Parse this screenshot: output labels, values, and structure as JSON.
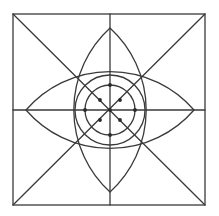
{
  "diagram": {
    "title": "",
    "colors": {
      "background": "#ffffff",
      "stroke": "#3a3a3a",
      "point": "#2a2a2a"
    },
    "square": {
      "x1": 13,
      "y1": 14,
      "x2": 205,
      "y2": 205
    },
    "center": {
      "x": 110,
      "y": 110
    },
    "circles": [
      {
        "name": "outer-circle",
        "r": 35
      },
      {
        "name": "inner-circle",
        "r": 25
      }
    ],
    "lenses": [
      {
        "name": "vertical-lens",
        "tip_a": [
          110,
          28
        ],
        "tip_b": [
          110,
          192
        ],
        "arc_radius": 111
      },
      {
        "name": "horizontal-lens",
        "tip_a": [
          26,
          110
        ],
        "tip_b": [
          194,
          110
        ],
        "arc_radius": 111
      }
    ],
    "points": [
      {
        "name": "center-point",
        "x": 110,
        "y": 110
      },
      {
        "name": "top-point",
        "x": 110,
        "y": 85
      },
      {
        "name": "bottom-point",
        "x": 110,
        "y": 135
      },
      {
        "name": "left-point",
        "x": 85,
        "y": 110
      },
      {
        "name": "right-point",
        "x": 135,
        "y": 110
      },
      {
        "name": "upper-left-point",
        "x": 100,
        "y": 100
      },
      {
        "name": "upper-right-point",
        "x": 120,
        "y": 100
      },
      {
        "name": "lower-left-point",
        "x": 100,
        "y": 120
      },
      {
        "name": "lower-right-point",
        "x": 120,
        "y": 120
      }
    ]
  }
}
